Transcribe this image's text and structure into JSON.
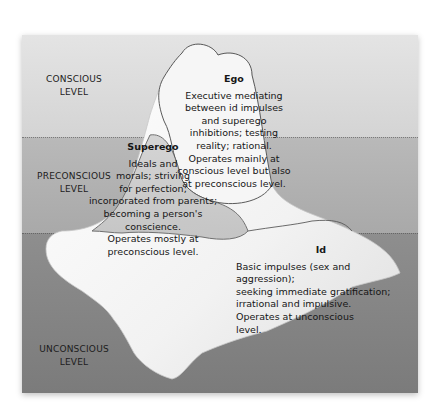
{
  "diagram": {
    "type": "iceberg",
    "colors": {
      "conscious_band": "#dcdcdc",
      "preconscious_band": "#b2b2b2",
      "unconscious_band": "#858585",
      "iceberg": "#f4f4f4",
      "outline": "#5a5a5a"
    },
    "levels": [
      {
        "line1": "CONSCIOUS",
        "line2": "LEVEL"
      },
      {
        "line1": "PRECONSCIOUS",
        "line2": "LEVEL"
      },
      {
        "line1": "UNCONSCIOUS",
        "line2": "LEVEL"
      }
    ],
    "regions": {
      "ego": {
        "title": "Ego",
        "lines": [
          "Executive mediating",
          "between id impulses",
          "and superego",
          "inhibitions; testing",
          "reality; rational.",
          "Operates mainly at",
          "conscious level but also",
          "at preconscious level."
        ]
      },
      "superego": {
        "title": "Superego",
        "lines": [
          "Ideals and",
          "morals; striving",
          "for perfection;",
          "incorporated from parents;",
          "becoming a person's conscience.",
          "Operates mostly at",
          "preconscious level."
        ]
      },
      "id": {
        "title": "Id",
        "lines": [
          "Basic impulses (sex and aggression);",
          "seeking immediate gratification;",
          "irrational and impulsive.",
          "Operates at unconscious",
          "level."
        ]
      }
    }
  }
}
